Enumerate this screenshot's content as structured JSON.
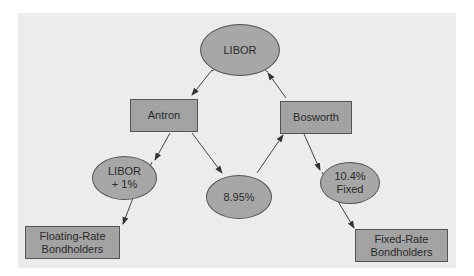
{
  "diagram": {
    "type": "interest-rate-swap-flow",
    "nodes": {
      "libor": {
        "label": "LIBOR",
        "shape": "ellipse"
      },
      "antron": {
        "label": "Antron",
        "shape": "rect"
      },
      "bosworth": {
        "label": "Bosworth",
        "shape": "rect"
      },
      "libor_plus": {
        "label": "LIBOR\n+ 1%",
        "shape": "ellipse"
      },
      "swap_rate": {
        "label": "8.95%",
        "shape": "ellipse"
      },
      "fixed_rate": {
        "label": "10.4%\nFixed",
        "shape": "ellipse"
      },
      "floating_bondholders": {
        "label": "Floating-Rate\nBondholders",
        "shape": "rect"
      },
      "fixed_bondholders": {
        "label": "Fixed-Rate\nBondholders",
        "shape": "rect"
      }
    },
    "edges": [
      {
        "from": "bosworth",
        "to": "libor",
        "via": "libor"
      },
      {
        "from": "libor",
        "to": "antron"
      },
      {
        "from": "antron",
        "to": "floating_bondholders",
        "via": "libor_plus"
      },
      {
        "from": "antron",
        "to": "bosworth",
        "via": "swap_rate"
      },
      {
        "from": "bosworth",
        "to": "fixed_bondholders",
        "via": "fixed_rate"
      }
    ],
    "colors": {
      "panel": "#ececec",
      "node_fill": "#a7a7a7",
      "stroke": "#555555",
      "text": "#2a2a2a"
    }
  }
}
